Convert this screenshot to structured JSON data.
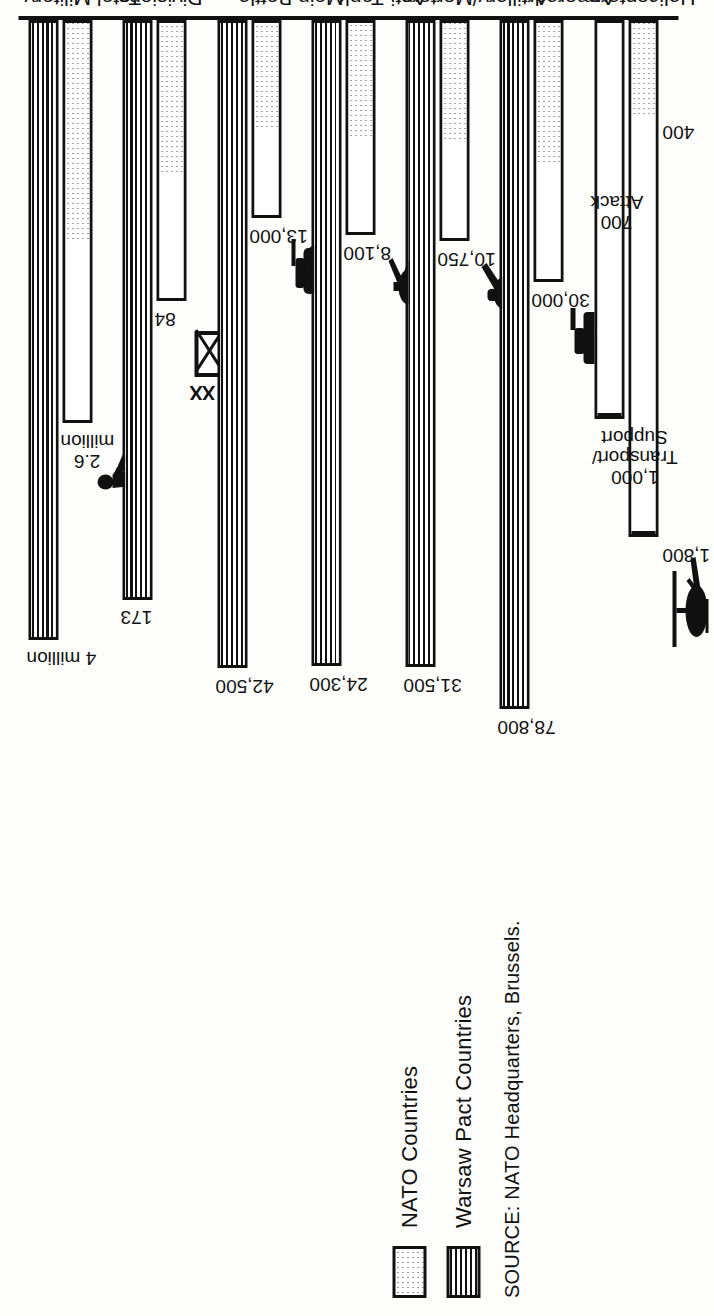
{
  "legend": {
    "items": [
      {
        "label": "NATO Countries",
        "pattern": "dotted",
        "key": "nato"
      },
      {
        "label": "Warsaw Pact Countries",
        "pattern": "horizontal-stripes",
        "key": "wp"
      }
    ]
  },
  "source": "SOURCE: NATO Headquarters, Brussels.",
  "annotations": {
    "division_symbol_label": "XX"
  },
  "chart_data": {
    "type": "bar",
    "orientation": "horizontal",
    "title": "",
    "xlabel": "",
    "ylabel": "",
    "grid": false,
    "legend_position": "top-left",
    "series": [
      {
        "name": "NATO Countries",
        "key": "nato",
        "pattern": "dotted"
      },
      {
        "name": "Warsaw Pact Countries",
        "key": "wp",
        "pattern": "horizontal-stripes"
      }
    ],
    "categories": [
      {
        "label": "Total Military\nManpower",
        "label_lines": [
          "Total Military",
          "Manpower"
        ],
        "sublabel_lines": [],
        "nato": {
          "value": 2600000,
          "label": "2.6",
          "label_unit": "million"
        },
        "wp": {
          "value": 4000000,
          "label": "4 million",
          "label_unit": ""
        }
      },
      {
        "label": "Divisions",
        "label_lines": [
          "Divisions"
        ],
        "sublabel_lines": [],
        "nato": {
          "value": 84,
          "label": "84",
          "label_unit": ""
        },
        "wp": {
          "value": 173,
          "label": "173",
          "label_unit": ""
        }
      },
      {
        "label": "Main Battle Tanks",
        "label_lines": [
          "Main Battle",
          "Tanks"
        ],
        "sublabel_lines": [
          "(Main armament",
          "90 mm. and above)"
        ],
        "nato": {
          "value": 13000,
          "label": "13,000",
          "label_unit": ""
        },
        "wp": {
          "value": 42500,
          "label": "42,500",
          "label_unit": ""
        }
      },
      {
        "label": "Anti-Tank Guided Weapon Launchers",
        "label_lines": [
          "Anti-Tank",
          "Guided Weapon",
          "Launchers"
        ],
        "sublabel_lines": [
          "(Crew served",
          "and/or mounted)"
        ],
        "nato": {
          "value": 8100,
          "label": "8,100",
          "label_unit": ""
        },
        "wp": {
          "value": 24300,
          "label": "24,300",
          "label_unit": ""
        }
      },
      {
        "label": "Artillery/Mortars",
        "label_lines": [
          "Artillery/Mortars"
        ],
        "sublabel_lines": [
          "(100 mm. and",
          "above",
          "including Rocket",
          "Launchers)"
        ],
        "nato": {
          "value": 10750,
          "label": "10,750",
          "label_unit": ""
        },
        "wp": {
          "value": 31500,
          "label": "31,500",
          "label_unit": ""
        }
      },
      {
        "label": "Armored Personnel Carriers, Infantry Fighting Vehicles",
        "label_lines": [
          "Armored",
          "Personnel",
          "Carriers, Infantry",
          "Fighting Vehicles"
        ],
        "sublabel_lines": [],
        "nato": {
          "value": 30000,
          "label": "30,000",
          "label_unit": ""
        },
        "wp": {
          "value": 78800,
          "label": "78,800",
          "label_unit": ""
        }
      },
      {
        "label": "Helicopters",
        "label_lines": [
          "Helicopters"
        ],
        "sublabel_lines": [],
        "stacked": true,
        "segment_names": [
          "Transport/Support",
          "Attack"
        ],
        "nato": {
          "value": 2200,
          "segments": [
            {
              "name": "Transport/ Support",
              "value": 1800,
              "label": "1,800"
            },
            {
              "name": "Attack",
              "value": 400,
              "label": "400"
            }
          ]
        },
        "wp": {
          "value": 1700,
          "segments": [
            {
              "name": "Transport/ Support",
              "value": 1000,
              "label": "1,000"
            },
            {
              "name": "Attack",
              "value": 700,
              "label": "700"
            }
          ]
        }
      }
    ]
  }
}
